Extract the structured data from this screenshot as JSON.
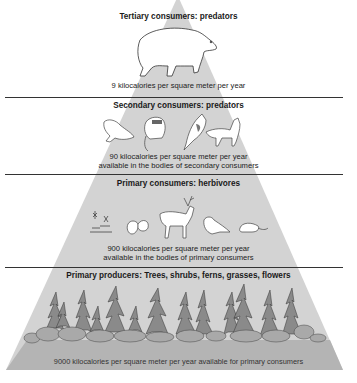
{
  "diagram": {
    "type": "energy-pyramid",
    "colors": {
      "pyramid_fill": "#d3d3d3",
      "ground_fill": "#b4b4b4",
      "divider": "#333333",
      "background": "#ffffff"
    },
    "levels": [
      {
        "id": "tertiary",
        "title": "Tertiary consumers: predators",
        "caption_line1": "9 kilocalories per square meter per year",
        "caption_line2": "",
        "organisms": [
          "polar-bear"
        ]
      },
      {
        "id": "secondary",
        "title": "Secondary consumers: predators",
        "caption_line1": "90 kilocalories per square meter per year",
        "caption_line2": "available in the bodies of secondary consumers",
        "organisms": [
          "frog",
          "raccoon",
          "jay-bird",
          "fox"
        ]
      },
      {
        "id": "primary-consumers",
        "title": "Primary consumers: herbivores",
        "caption_line1": "900 kilocalories per square meter per year",
        "caption_line2": "available in the bodies of primary consumers",
        "organisms": [
          "insects",
          "squirrel",
          "deer",
          "bird",
          "mouse"
        ]
      },
      {
        "id": "primary-producers",
        "title": "Primary producers: Trees, shrubs, ferns, grasses, flowers",
        "caption_line1": "9000 kilocalories per square meter per year available for primary consumers",
        "caption_line2": "",
        "organisms": [
          "conifer-forest",
          "shrubs"
        ]
      }
    ]
  }
}
